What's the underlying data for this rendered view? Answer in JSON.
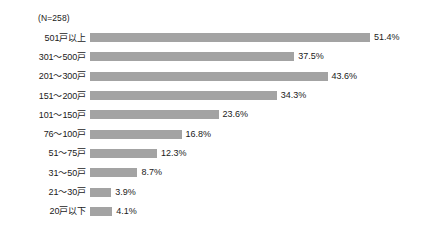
{
  "chart_data": {
    "type": "bar",
    "orientation": "horizontal",
    "title": "",
    "subtitle": "",
    "sample_size_label": "(N=258)",
    "xlabel": "",
    "ylabel": "",
    "xlim": [
      0,
      51.4
    ],
    "grid": false,
    "legend": null,
    "value_suffix": "%",
    "bar_color": "#a3a3a3",
    "background_color": "#ffffff",
    "text_color": "#1a1a1a",
    "categories": [
      "501戸以上",
      "301～500戸",
      "201～300戸",
      "151～200戸",
      "101～150戸",
      "76～100戸",
      "51～75戸",
      "31～50戸",
      "21～30戸",
      "20戸以下"
    ],
    "values": [
      51.4,
      37.5,
      43.6,
      34.3,
      23.6,
      16.8,
      12.3,
      8.7,
      3.9,
      4.1
    ],
    "value_labels": [
      "51.4%",
      "37.5%",
      "43.6%",
      "34.3%",
      "23.6%",
      "16.8%",
      "12.3%",
      "8.7%",
      "3.9%",
      "4.1%"
    ],
    "rows": [
      {
        "category": "501戸以上",
        "value": 51.4,
        "label": "51.4%"
      },
      {
        "category": "301～500戸",
        "value": 37.5,
        "label": "37.5%"
      },
      {
        "category": "201～300戸",
        "value": 43.6,
        "label": "43.6%"
      },
      {
        "category": "151～200戸",
        "value": 34.3,
        "label": "34.3%"
      },
      {
        "category": "101～150戸",
        "value": 23.6,
        "label": "23.6%"
      },
      {
        "category": "76～100戸",
        "value": 16.8,
        "label": "16.8%"
      },
      {
        "category": "51～75戸",
        "value": 12.3,
        "label": "12.3%"
      },
      {
        "category": "31～50戸",
        "value": 8.7,
        "label": "8.7%"
      },
      {
        "category": "21～30戸",
        "value": 3.9,
        "label": "3.9%"
      },
      {
        "category": "20戸以下",
        "value": 4.1,
        "label": "4.1%"
      }
    ]
  }
}
